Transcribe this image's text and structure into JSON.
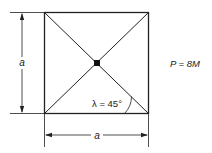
{
  "figure": {
    "square_side_label": "a",
    "left_dimension_label": "a",
    "bottom_dimension_label": "a",
    "angle_label": "λ = 45°",
    "load_label": "P = 8M",
    "colors": {
      "line": "#222222",
      "background": "#ffffff"
    }
  }
}
